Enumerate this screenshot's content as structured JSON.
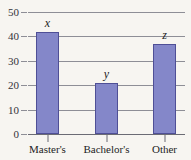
{
  "chart_data": {
    "type": "bar",
    "title": "",
    "subtitle": "",
    "xlabel": "",
    "ylabel": "",
    "categories": [
      "Master's",
      "Bachelor's",
      "Other"
    ],
    "values": [
      42,
      21,
      37
    ],
    "point_labels": [
      "x",
      "y",
      "z"
    ],
    "ylim": [
      0,
      50
    ],
    "ytick_labels": [
      "0",
      "10",
      "20",
      "30",
      "40",
      "50"
    ],
    "ytick_values": [
      0,
      10,
      20,
      30,
      40,
      50
    ],
    "grid": true,
    "legend": "none",
    "series": [
      {
        "name": "",
        "values": [
          42,
          21,
          37
        ]
      }
    ],
    "colors": {
      "bar_fill": "#8487c9",
      "bar_border": "#4f4f96",
      "grid": "#8e8e96",
      "axis": "#6b6b74",
      "background": "#f7f5f1",
      "text": "#1d1d24"
    }
  }
}
